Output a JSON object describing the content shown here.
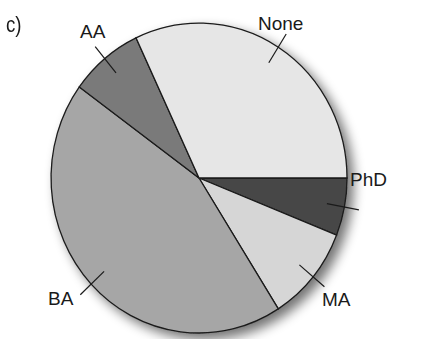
{
  "panel_label": "c)",
  "chart_data": {
    "type": "pie",
    "title": "",
    "panel": "c)",
    "start_angle_deg": 0,
    "direction": "clockwise",
    "categories": [
      "PhD",
      "MA",
      "BA",
      "AA",
      "None"
    ],
    "values": [
      6,
      10,
      44,
      8,
      32
    ],
    "unit": "percent (estimated from slice angles)",
    "colors": [
      "#474747",
      "#d6d6d6",
      "#a6a6a6",
      "#7a7a7a",
      "#e6e6e6"
    ],
    "legend": "none (direct callout labels)",
    "labels": [
      {
        "text": "PhD",
        "x": 350,
        "y": 186
      },
      {
        "text": "MA",
        "x": 322,
        "y": 306
      },
      {
        "text": "BA",
        "x": 48,
        "y": 305
      },
      {
        "text": "AA",
        "x": 80,
        "y": 38
      },
      {
        "text": "None",
        "x": 258,
        "y": 30
      }
    ]
  }
}
